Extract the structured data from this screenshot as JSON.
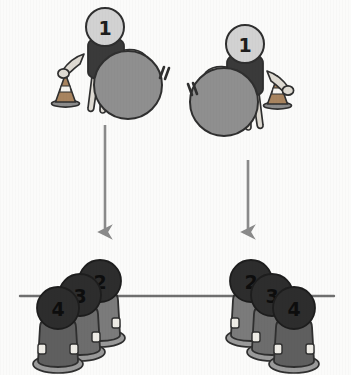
{
  "diagram": {
    "background_color": "#fbfbfa",
    "stations": [
      {
        "name": "left-station",
        "orientation": "ball-right-cone-left",
        "thrower": {
          "label": "1",
          "head_color": "#d2d2d2",
          "shirt_color": "#3a3a3a",
          "skin_color": "#d8d4cc"
        },
        "ball": {
          "color": "#8f8f8f",
          "motion_lines": 2
        },
        "cone": {
          "color": "#9a7a5e",
          "stripe_color": "#ffffff"
        },
        "arrow": {
          "direction": "down",
          "color": "#8a8a8a"
        },
        "seated": [
          {
            "label": "2",
            "head_color": "#2d2d2d",
            "shirt_color": "#7b7b7b"
          },
          {
            "label": "3",
            "head_color": "#2d2d2d",
            "shirt_color": "#6d6d6d"
          },
          {
            "label": "4",
            "head_color": "#2d2d2d",
            "shirt_color": "#5f5f5f"
          }
        ]
      },
      {
        "name": "right-station",
        "orientation": "ball-left-cone-right",
        "thrower": {
          "label": "1",
          "head_color": "#d2d2d2",
          "shirt_color": "#3a3a3a",
          "skin_color": "#d8d4cc"
        },
        "ball": {
          "color": "#8f8f8f",
          "motion_lines": 2
        },
        "cone": {
          "color": "#9a7a5e",
          "stripe_color": "#ffffff"
        },
        "arrow": {
          "direction": "down",
          "color": "#8a8a8a"
        },
        "seated": [
          {
            "label": "2",
            "head_color": "#2d2d2d",
            "shirt_color": "#7b7b7b"
          },
          {
            "label": "3",
            "head_color": "#2d2d2d",
            "shirt_color": "#6d6d6d"
          },
          {
            "label": "4",
            "head_color": "#2d2d2d",
            "shirt_color": "#5f5f5f"
          }
        ]
      }
    ],
    "ground_line": {
      "color": "#6f6f6f"
    },
    "outline_color": "#2f2f2f"
  }
}
